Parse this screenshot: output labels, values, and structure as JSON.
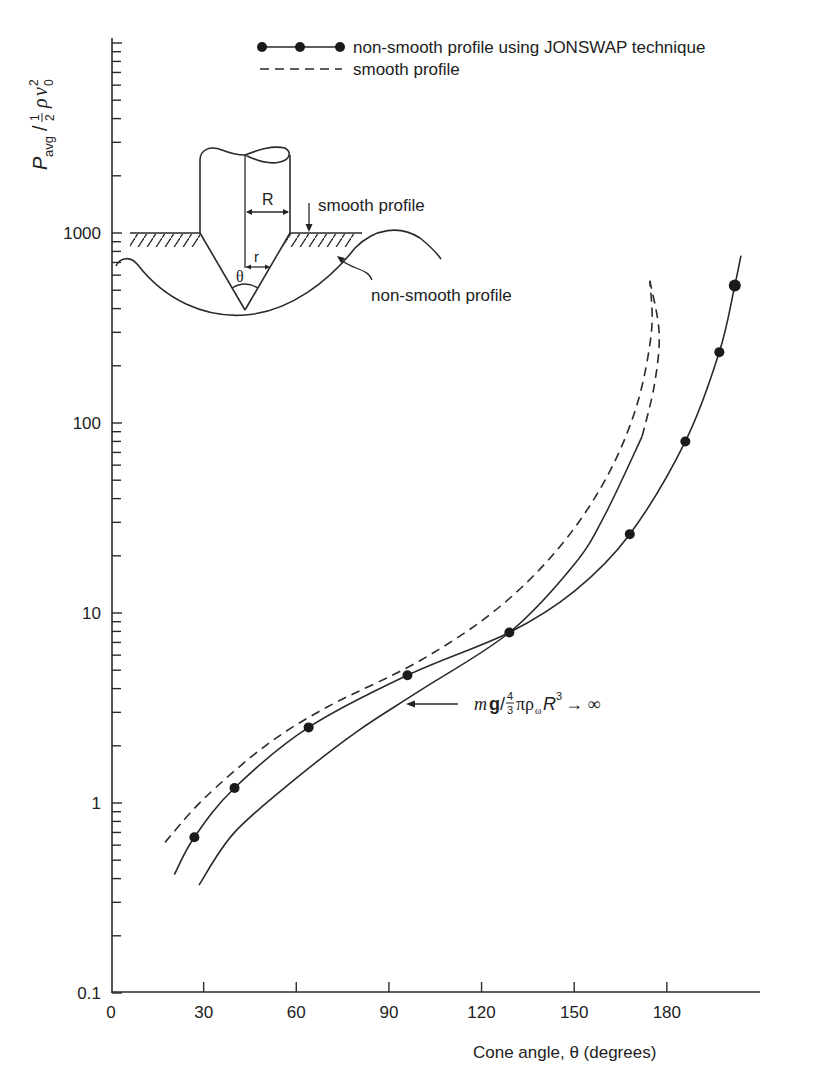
{
  "chart_data": {
    "type": "line",
    "title": "",
    "xlabel": "Cone angle, θ (degrees)",
    "ylabel": "P_avg / ½ ρ v₀²",
    "ylabel_parts": {
      "main": "P",
      "sub": "avg",
      "frac_num": "1",
      "frac_den": "2",
      "rho": "ρ",
      "v": "v",
      "v_sub": "0",
      "v_sup": "2"
    },
    "xscale": "linear",
    "yscale": "log",
    "xlim": [
      0,
      210
    ],
    "ylim": [
      0.1,
      10000
    ],
    "x_ticks": [
      0,
      30,
      60,
      90,
      120,
      150,
      180
    ],
    "x_tick_labels": [
      "0",
      "30",
      "60",
      "90",
      "120",
      "150",
      "180"
    ],
    "y_tick_labels": [
      {
        "value": 1000,
        "label": "1000"
      },
      {
        "value": 100,
        "label": "100"
      },
      {
        "value": 10,
        "label": "10"
      },
      {
        "value": 1,
        "label": "1"
      },
      {
        "value": 0.1,
        "label": "0.1"
      }
    ],
    "grid": false,
    "legend_position": "top-right",
    "legend": [
      {
        "label": "non-smooth profile using JONSWAP technique",
        "style": "solid-with-markers"
      },
      {
        "label": "smooth profile",
        "style": "dashed"
      }
    ],
    "series": [
      {
        "name": "non-smooth profile using JONSWAP technique",
        "style": "solid-with-markers",
        "markers": [
          {
            "x": 27,
            "y": 0.66
          },
          {
            "x": 40,
            "y": 1.2
          },
          {
            "x": 64,
            "y": 2.5
          },
          {
            "x": 96,
            "y": 4.7
          },
          {
            "x": 129,
            "y": 7.9
          },
          {
            "x": 168,
            "y": 26
          },
          {
            "x": 186,
            "y": 80
          },
          {
            "x": 197,
            "y": 236
          },
          {
            "x": 202,
            "y": 530
          }
        ],
        "curve": [
          {
            "x": 20.5,
            "y": 0.42
          },
          {
            "x": 27,
            "y": 0.66
          },
          {
            "x": 40,
            "y": 1.2
          },
          {
            "x": 64,
            "y": 2.5
          },
          {
            "x": 96,
            "y": 4.7
          },
          {
            "x": 129,
            "y": 7.9
          },
          {
            "x": 150,
            "y": 13
          },
          {
            "x": 168,
            "y": 26
          },
          {
            "x": 186,
            "y": 80
          },
          {
            "x": 197,
            "y": 236
          },
          {
            "x": 202,
            "y": 530
          },
          {
            "x": 204,
            "y": 760
          }
        ]
      },
      {
        "name": "smooth profile",
        "style": "dashed",
        "curve": [
          {
            "x": 17.5,
            "y": 0.62
          },
          {
            "x": 30,
            "y": 1.05
          },
          {
            "x": 50,
            "y": 2.0
          },
          {
            "x": 70,
            "y": 3.2
          },
          {
            "x": 100,
            "y": 5.6
          },
          {
            "x": 125,
            "y": 10.5
          },
          {
            "x": 145,
            "y": 22
          },
          {
            "x": 160,
            "y": 50
          },
          {
            "x": 170,
            "y": 120
          },
          {
            "x": 175,
            "y": 300
          },
          {
            "x": 174.5,
            "y": 560
          }
        ]
      },
      {
        "name": "mg / (4/3) π ρ_ω R³ → ∞",
        "style": "solid-then-dashed",
        "curve": [
          {
            "x": 28.5,
            "y": 0.37
          },
          {
            "x": 40,
            "y": 0.7
          },
          {
            "x": 60,
            "y": 1.35
          },
          {
            "x": 80,
            "y": 2.4
          },
          {
            "x": 100,
            "y": 3.9
          },
          {
            "x": 129,
            "y": 7.9
          },
          {
            "x": 150,
            "y": 18
          },
          {
            "x": 160,
            "y": 33
          },
          {
            "x": 172,
            "y": 85
          }
        ],
        "dashed_continuation": [
          {
            "x": 172,
            "y": 85
          },
          {
            "x": 176,
            "y": 160
          },
          {
            "x": 177.5,
            "y": 300
          },
          {
            "x": 174.5,
            "y": 560
          }
        ]
      }
    ],
    "annotations": [
      {
        "text_parts": {
          "m": "m",
          "g": "g",
          "slash": "/",
          "num": "4",
          "den": "3",
          "rest": "πρ",
          "rho_sub": "ω",
          "R": "R",
          "R_sup": "3",
          "arrow": "→ ∞"
        },
        "arrow_to": {
          "x": 96,
          "y": 3.5
        }
      }
    ]
  },
  "inset": {
    "labels": {
      "R": "R",
      "r": "r",
      "theta": "θ",
      "smooth": "smooth profile",
      "non_smooth": "non-smooth profile"
    }
  }
}
